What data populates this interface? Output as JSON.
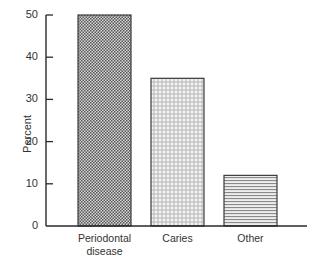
{
  "chart_data": {
    "type": "bar",
    "title": "",
    "xlabel": "",
    "ylabel": "Percent",
    "categories": [
      "Periodontal disease",
      "Caries",
      "Other"
    ],
    "category_lines": [
      [
        "Periodontal",
        "disease"
      ],
      [
        "Caries"
      ],
      [
        "Other"
      ]
    ],
    "values": [
      50,
      35,
      12
    ],
    "ylim": [
      0,
      50
    ],
    "yticks": [
      0,
      10,
      20,
      30,
      40,
      50
    ],
    "grid": false,
    "legend": null,
    "bar_patterns": [
      "dense-checker",
      "small-circles",
      "horizontal-lines"
    ]
  },
  "colors": {
    "axis": "#2a2a2a",
    "bar_outline": "#3a3a3a",
    "pattern_dark": "#555555",
    "background": "#ffffff"
  }
}
